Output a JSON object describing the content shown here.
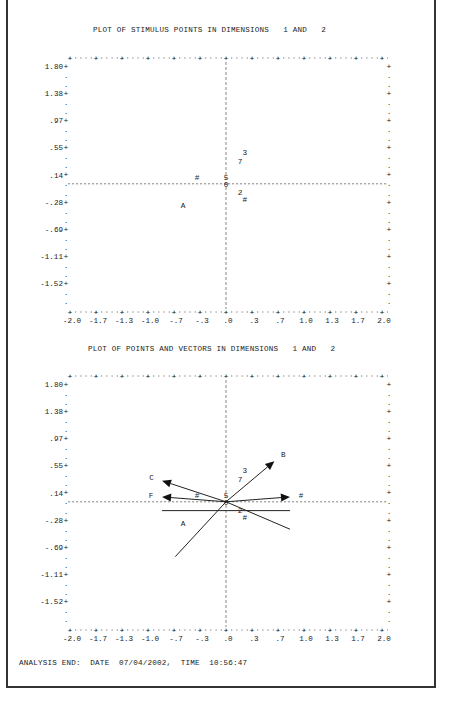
{
  "plots": [
    {
      "title": "PLOT OF STIMULUS POINTS IN DIMENSIONS   1 AND   2",
      "y_ticks": [
        "1.80",
        "1.38",
        ".97",
        ".55",
        ".14",
        "-.28",
        "-.69",
        "-1.11",
        "-1.52"
      ],
      "x_ticks": [
        "-2.0",
        "-1.7",
        "-1.3",
        "-1.0",
        "-.7",
        "-.3",
        ".0",
        ".3",
        ".7",
        "1.0",
        "1.3",
        "1.7",
        "2.0"
      ],
      "points": [
        {
          "label": "3",
          "x": 0.24,
          "y": 0.65
        },
        {
          "label": "7",
          "x": 0.18,
          "y": 0.47
        },
        {
          "label": "#",
          "x": -0.37,
          "y": 0.14
        },
        {
          "label": "5",
          "x": 0.0,
          "y": 0.14
        },
        {
          "label": "0",
          "x": 0.0,
          "y": 0.0
        },
        {
          "label": "2",
          "x": 0.18,
          "y": -0.17
        },
        {
          "label": "#",
          "x": 0.24,
          "y": -0.32
        },
        {
          "label": "A",
          "x": -0.55,
          "y": -0.43
        }
      ]
    },
    {
      "title": "PLOT OF POINTS AND VECTORS IN DIMENSIONS   1 AND   2",
      "y_ticks": [
        "1.80",
        "1.38",
        ".97",
        ".55",
        ".14",
        "-.28",
        "-.69",
        "-1.11",
        "-1.52"
      ],
      "x_ticks": [
        "-2.0",
        "-1.7",
        "-1.3",
        "-1.0",
        "-.7",
        "-.3",
        ".0",
        ".3",
        ".7",
        "1.0",
        "1.3",
        "1.7",
        "2.0"
      ],
      "points": [
        {
          "label": "3",
          "x": 0.24,
          "y": 0.65
        },
        {
          "label": "7",
          "x": 0.18,
          "y": 0.47
        },
        {
          "label": "#",
          "x": -0.37,
          "y": 0.14
        },
        {
          "label": "5",
          "x": 0.0,
          "y": 0.14
        },
        {
          "label": "0",
          "x": 0.0,
          "y": 0.0
        },
        {
          "label": "2",
          "x": 0.18,
          "y": -0.17
        },
        {
          "label": "#",
          "x": 0.24,
          "y": -0.32
        },
        {
          "label": "A",
          "x": -0.55,
          "y": -0.43
        }
      ],
      "vectors": [
        {
          "label": "B",
          "x": 0.62,
          "y": 0.83
        },
        {
          "label": "C",
          "x": -0.82,
          "y": 0.43
        },
        {
          "label": "F",
          "x": -0.82,
          "y": 0.1
        },
        {
          "label": "#",
          "x": 0.82,
          "y": 0.1
        }
      ],
      "lines": [
        {
          "x1": -0.82,
          "y1": -0.18,
          "x2": 0.82,
          "y2": -0.18
        },
        {
          "x1": -0.65,
          "y1": -1.12,
          "x2": 0.0,
          "y2": 0.0
        },
        {
          "x1": 0.0,
          "y1": 0.0,
          "x2": 0.82,
          "y2": -0.56
        }
      ]
    }
  ],
  "footer": "ANALYSIS END:  DATE  07/04/2002,  TIME  10:56:47",
  "chart_data": [
    {
      "type": "scatter",
      "title": "PLOT OF STIMULUS POINTS IN DIMENSIONS 1 AND 2",
      "xlabel": "Dimension 1",
      "ylabel": "Dimension 2",
      "xlim": [
        -2.0,
        2.0
      ],
      "ylim": [
        -1.73,
        1.8
      ],
      "x_tick_labels": [
        "-2.0",
        "-1.7",
        "-1.3",
        "-1.0",
        "-.7",
        "-.3",
        ".0",
        ".3",
        ".7",
        "1.0",
        "1.3",
        "1.7",
        "2.0"
      ],
      "y_tick_labels": [
        "1.80",
        "1.38",
        ".97",
        ".55",
        ".14",
        "-.28",
        "-.69",
        "-1.11",
        "-1.52"
      ],
      "grid": false,
      "series": [
        {
          "name": "stimulus points",
          "labels": [
            "3",
            "7",
            "#",
            "5",
            "0",
            "2",
            "#",
            "A"
          ],
          "x": [
            0.24,
            0.18,
            -0.37,
            0.0,
            0.0,
            0.18,
            0.24,
            -0.55
          ],
          "y": [
            0.65,
            0.47,
            0.14,
            0.14,
            0.0,
            -0.17,
            -0.32,
            -0.43
          ]
        }
      ]
    },
    {
      "type": "scatter",
      "title": "PLOT OF POINTS AND VECTORS IN DIMENSIONS 1 AND 2",
      "xlabel": "Dimension 1",
      "ylabel": "Dimension 2",
      "xlim": [
        -2.0,
        2.0
      ],
      "ylim": [
        -1.73,
        1.8
      ],
      "x_tick_labels": [
        "-2.0",
        "-1.7",
        "-1.3",
        "-1.0",
        "-.7",
        "-.3",
        ".0",
        ".3",
        ".7",
        "1.0",
        "1.3",
        "1.7",
        "2.0"
      ],
      "y_tick_labels": [
        "1.80",
        "1.38",
        ".97",
        ".55",
        ".14",
        "-.28",
        "-.69",
        "-1.11",
        "-1.52"
      ],
      "grid": false,
      "series": [
        {
          "name": "points",
          "labels": [
            "3",
            "7",
            "#",
            "5",
            "0",
            "2",
            "#",
            "A"
          ],
          "x": [
            0.24,
            0.18,
            -0.37,
            0.0,
            0.0,
            0.18,
            0.24,
            -0.55
          ],
          "y": [
            0.65,
            0.47,
            0.14,
            0.14,
            0.0,
            -0.17,
            -0.32,
            -0.43
          ]
        },
        {
          "name": "vectors (arrow tips)",
          "labels": [
            "B",
            "C",
            "F",
            "#"
          ],
          "x": [
            0.62,
            -0.82,
            -0.82,
            0.82
          ],
          "y": [
            0.83,
            0.43,
            0.1,
            0.1
          ]
        }
      ]
    }
  ]
}
